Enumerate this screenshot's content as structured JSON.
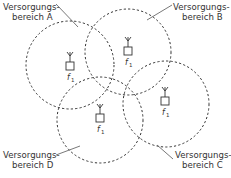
{
  "diagram": {
    "areas": [
      {
        "id": "A",
        "line1": "Versorgungs-",
        "line2": "bereich A",
        "freq": "f",
        "freq_sub": "1"
      },
      {
        "id": "B",
        "line1": "Versorgungs-",
        "line2": "bereich B",
        "freq": "f",
        "freq_sub": "1"
      },
      {
        "id": "C",
        "line1": "Versorgungs-",
        "line2": "bereich C",
        "freq": "f",
        "freq_sub": "1"
      },
      {
        "id": "D",
        "line1": "Versorgungs-",
        "line2": "bereich D",
        "freq": "f",
        "freq_sub": "1"
      }
    ]
  }
}
